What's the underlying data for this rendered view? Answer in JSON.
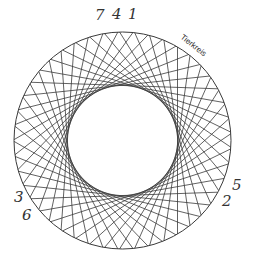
{
  "diagram": {
    "title_label": "Tierkreis",
    "center": {
      "x": 122.5,
      "y": 140.5
    },
    "outer_radius": 108.5,
    "inner_radius": 55,
    "chord_count": 45,
    "line_color": "#3a3a3a",
    "labels_top": [
      "7",
      "4",
      "1"
    ],
    "labels_left": [
      "3",
      "6"
    ],
    "labels_right": [
      "5",
      "2"
    ]
  }
}
